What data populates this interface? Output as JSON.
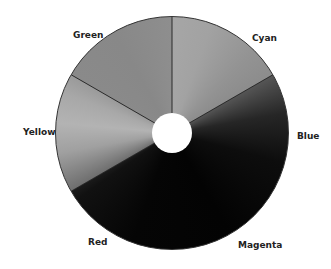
{
  "diagram": {
    "type": "color-wheel",
    "rendering": "grayscale",
    "center": [
      172,
      133
    ],
    "outer_radius": 117,
    "inner_radius": 20,
    "dividers_deg_clockwise_from_top": [
      0,
      60,
      240,
      300
    ],
    "segments": [
      {
        "label": "Cyan",
        "shade": "#9c9c9c"
      },
      {
        "label": "Blue",
        "shade": "#1a1a1a"
      },
      {
        "label": "Magenta",
        "shade": "#050505"
      },
      {
        "label": "Red",
        "shade": "#080808"
      },
      {
        "label": "Yellow",
        "shade": "#ababab"
      },
      {
        "label": "Green",
        "shade": "#8a8a8a"
      }
    ]
  },
  "labels": {
    "green": "Green",
    "cyan": "Cyan",
    "yellow": "Yellow",
    "blue": "Blue",
    "red": "Red",
    "magenta": "Magenta"
  }
}
